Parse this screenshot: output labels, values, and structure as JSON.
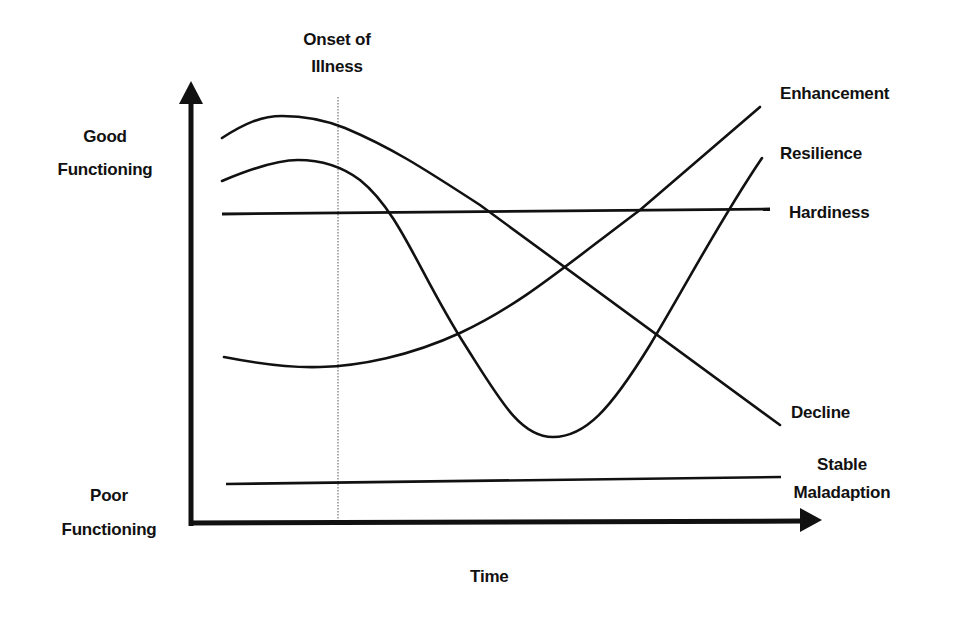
{
  "diagram": {
    "onset_label_line1": "Onset of",
    "onset_label_line2": "Illness",
    "y_axis": {
      "top_label_line1": "Good",
      "top_label_line2": "Functioning",
      "bottom_label_line1": "Poor",
      "bottom_label_line2": "Functioning"
    },
    "x_axis": {
      "label": "Time"
    },
    "curves": [
      {
        "name": "Enhancement",
        "label": "Enhancement"
      },
      {
        "name": "Resilience",
        "label": "Resilience"
      },
      {
        "name": "Hardiness",
        "label": "Hardiness"
      },
      {
        "name": "Decline",
        "label": "Decline"
      },
      {
        "name": "Stable Maladaption",
        "label_line1": "Stable",
        "label_line2": "Maladaption"
      }
    ],
    "colors": {
      "line": "#111111",
      "onset_line": "#555555",
      "background": "#ffffff"
    }
  }
}
